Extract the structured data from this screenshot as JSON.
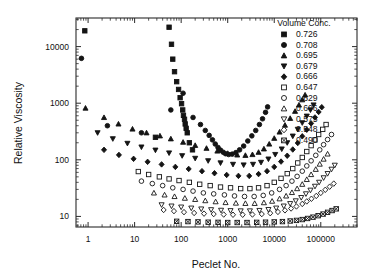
{
  "chart_data": {
    "type": "scatter",
    "title": "",
    "xlabel": "Peclet No.",
    "ylabel": "Relative Viscosity",
    "xscale": "log",
    "yscale": "log",
    "xlim": [
      0.55,
      600000
    ],
    "ylim": [
      6.5,
      32000
    ],
    "xticks": [
      1,
      10,
      100,
      1000,
      10000,
      100000
    ],
    "xticklabels": [
      "1",
      "10",
      "100",
      "1000",
      "10000",
      "100000"
    ],
    "yticks": [
      10,
      100,
      1000,
      10000
    ],
    "yticklabels": [
      "10",
      "100",
      "1000",
      "10000"
    ],
    "grid": false,
    "legend_position": "top-right",
    "legend_title": "Volume Conc.",
    "series": [
      {
        "name": "0.726",
        "marker": "square-filled",
        "points": [
          [
            0.85,
            19000
          ],
          [
            55,
            22000
          ],
          [
            62,
            11000
          ],
          [
            66,
            6000
          ],
          [
            72,
            3600
          ],
          [
            80,
            2400
          ],
          [
            88,
            1750
          ],
          [
            95,
            1250
          ],
          [
            102,
            980
          ],
          [
            108,
            760
          ],
          [
            112,
            610
          ],
          [
            118,
            520
          ],
          [
            122,
            430
          ],
          [
            128,
            360
          ],
          [
            135,
            300
          ],
          [
            28,
            250
          ],
          [
            150,
            200
          ],
          [
            175,
            150
          ]
        ]
      },
      {
        "name": "0.708",
        "marker": "circle-filled",
        "points": [
          [
            0.72,
            6200
          ],
          [
            110,
            1500
          ],
          [
            60,
            760
          ],
          [
            180,
            560
          ],
          [
            260,
            420
          ],
          [
            330,
            330
          ],
          [
            400,
            270
          ],
          [
            470,
            225
          ],
          [
            540,
            190
          ],
          [
            620,
            165
          ],
          [
            700,
            148
          ],
          [
            800,
            136
          ],
          [
            900,
            128
          ],
          [
            1050,
            124
          ],
          [
            1250,
            126
          ],
          [
            1500,
            134
          ],
          [
            1800,
            150
          ],
          [
            2200,
            175
          ],
          [
            2700,
            215
          ],
          [
            3300,
            265
          ],
          [
            4000,
            330
          ],
          [
            4800,
            420
          ],
          [
            5600,
            530
          ],
          [
            6500,
            690
          ],
          [
            7200,
            860
          ],
          [
            2.6,
            400
          ],
          [
            14,
            300
          ]
        ]
      },
      {
        "name": "0.695",
        "marker": "triangle-filled",
        "points": [
          [
            0.88,
            820
          ],
          [
            2.2,
            560
          ],
          [
            4.5,
            430
          ],
          [
            9,
            350
          ],
          [
            18,
            300
          ],
          [
            35,
            265
          ],
          [
            60,
            235
          ],
          [
            110,
            205
          ],
          [
            200,
            180
          ],
          [
            350,
            160
          ],
          [
            600,
            143
          ],
          [
            1000,
            130
          ],
          [
            1600,
            122
          ],
          [
            2400,
            120
          ],
          [
            3400,
            124
          ],
          [
            4600,
            136
          ],
          [
            6000,
            156
          ],
          [
            7800,
            190
          ],
          [
            10000,
            240
          ],
          [
            13000,
            310
          ],
          [
            17000,
            410
          ],
          [
            22000,
            540
          ],
          [
            28000,
            720
          ],
          [
            34000,
            930
          ],
          [
            40000,
            1150
          ],
          [
            46000,
            1400
          ]
        ]
      },
      {
        "name": "0.679",
        "marker": "triangle-down-filled",
        "points": [
          [
            1.6,
            300
          ],
          [
            3.4,
            235
          ],
          [
            7,
            195
          ],
          [
            14,
            168
          ],
          [
            28,
            148
          ],
          [
            55,
            132
          ],
          [
            105,
            118
          ],
          [
            200,
            106
          ],
          [
            380,
            96
          ],
          [
            700,
            88
          ],
          [
            1300,
            83
          ],
          [
            2200,
            81
          ],
          [
            3500,
            83
          ],
          [
            5200,
            90
          ],
          [
            7500,
            103
          ],
          [
            10500,
            124
          ],
          [
            14500,
            155
          ],
          [
            19000,
            200
          ],
          [
            25000,
            262
          ],
          [
            32000,
            345
          ],
          [
            40000,
            450
          ],
          [
            50000,
            590
          ],
          [
            60000,
            760
          ],
          [
            70000,
            930
          ]
        ]
      },
      {
        "name": "0.666",
        "marker": "diamond-filled",
        "points": [
          [
            2.2,
            150
          ],
          [
            4.6,
            122
          ],
          [
            9.5,
            104
          ],
          [
            19,
            92
          ],
          [
            38,
            83
          ],
          [
            75,
            75
          ],
          [
            145,
            69
          ],
          [
            280,
            63
          ],
          [
            520,
            58
          ],
          [
            950,
            54
          ],
          [
            1700,
            52
          ],
          [
            2900,
            52
          ],
          [
            4600,
            56
          ],
          [
            7000,
            63
          ],
          [
            10000,
            75
          ],
          [
            14000,
            93
          ],
          [
            19000,
            118
          ],
          [
            25000,
            152
          ],
          [
            32000,
            198
          ],
          [
            40000,
            260
          ],
          [
            50000,
            340
          ],
          [
            62000,
            440
          ],
          [
            75000,
            560
          ],
          [
            90000,
            700
          ],
          [
            105000,
            850
          ]
        ]
      },
      {
        "name": "0.647",
        "marker": "square-open",
        "points": [
          [
            12,
            62
          ],
          [
            20,
            55
          ],
          [
            34,
            50
          ],
          [
            55,
            46
          ],
          [
            90,
            43
          ],
          [
            150,
            40
          ],
          [
            250,
            37
          ],
          [
            420,
            35
          ],
          [
            700,
            33
          ],
          [
            1150,
            32
          ],
          [
            1900,
            31
          ],
          [
            3000,
            31
          ],
          [
            4600,
            32
          ],
          [
            7000,
            35
          ],
          [
            10000,
            40
          ],
          [
            14000,
            47
          ],
          [
            19000,
            57
          ],
          [
            25000,
            70
          ],
          [
            32000,
            88
          ],
          [
            40000,
            110
          ],
          [
            50000,
            140
          ],
          [
            62000,
            178
          ],
          [
            75000,
            225
          ],
          [
            90000,
            280
          ],
          [
            110000,
            345
          ],
          [
            130000,
            420
          ]
        ]
      },
      {
        "name": "0.629",
        "marker": "circle-open",
        "points": [
          [
            14,
            42
          ],
          [
            24,
            38
          ],
          [
            40,
            35
          ],
          [
            66,
            32
          ],
          [
            110,
            30
          ],
          [
            180,
            28
          ],
          [
            300,
            26
          ],
          [
            500,
            25
          ],
          [
            850,
            24
          ],
          [
            1400,
            23
          ],
          [
            2300,
            22.5
          ],
          [
            3700,
            22.5
          ],
          [
            5800,
            23.5
          ],
          [
            8800,
            26
          ],
          [
            13000,
            30
          ],
          [
            18000,
            35
          ],
          [
            24000,
            42
          ],
          [
            31000,
            51
          ],
          [
            40000,
            63
          ],
          [
            50000,
            78
          ],
          [
            62000,
            96
          ],
          [
            78000,
            120
          ],
          [
            95000,
            150
          ],
          [
            115000,
            185
          ],
          [
            140000,
            228
          ],
          [
            170000,
            280
          ]
        ]
      },
      {
        "name": "0.606",
        "marker": "triangle-open",
        "points": [
          [
            26,
            26
          ],
          [
            44,
            24
          ],
          [
            72,
            22.5
          ],
          [
            120,
            21
          ],
          [
            200,
            20
          ],
          [
            330,
            19
          ],
          [
            550,
            18.2
          ],
          [
            900,
            17.6
          ],
          [
            1500,
            17.2
          ],
          [
            2400,
            17
          ],
          [
            3800,
            17
          ],
          [
            6000,
            17.5
          ],
          [
            9000,
            18.6
          ],
          [
            13000,
            20.5
          ],
          [
            18000,
            23
          ],
          [
            24000,
            26.5
          ],
          [
            31000,
            31
          ],
          [
            40000,
            37
          ],
          [
            50000,
            45
          ],
          [
            62000,
            55
          ],
          [
            78000,
            68
          ],
          [
            95000,
            84
          ],
          [
            115000,
            103
          ],
          [
            140000,
            127
          ]
        ]
      },
      {
        "name": "0.575",
        "marker": "triangle-down-open",
        "points": [
          [
            38,
            16
          ],
          [
            62,
            15.2
          ],
          [
            100,
            14.6
          ],
          [
            165,
            14
          ],
          [
            270,
            13.5
          ],
          [
            440,
            13.1
          ],
          [
            720,
            12.8
          ],
          [
            1150,
            12.6
          ],
          [
            1900,
            12.5
          ],
          [
            3000,
            12.5
          ],
          [
            4800,
            12.7
          ],
          [
            7500,
            13.2
          ],
          [
            11000,
            14
          ],
          [
            16000,
            15.2
          ],
          [
            22000,
            16.8
          ],
          [
            29000,
            18.8
          ],
          [
            38000,
            21.5
          ],
          [
            48000,
            25
          ],
          [
            60000,
            29
          ],
          [
            75000,
            34
          ],
          [
            92000,
            40
          ],
          [
            115000,
            48
          ],
          [
            140000,
            57
          ],
          [
            170000,
            68
          ],
          [
            200000,
            80
          ]
        ]
      },
      {
        "name": "0.548",
        "marker": "diamond-open",
        "points": [
          [
            42,
            13
          ],
          [
            70,
            12.4
          ],
          [
            115,
            11.9
          ],
          [
            190,
            11.5
          ],
          [
            310,
            11.2
          ],
          [
            500,
            11
          ],
          [
            820,
            10.8
          ],
          [
            1300,
            10.7
          ],
          [
            2100,
            10.7
          ],
          [
            3400,
            10.8
          ],
          [
            5400,
            11
          ],
          [
            8200,
            11.4
          ],
          [
            12000,
            12
          ],
          [
            17000,
            12.8
          ],
          [
            23000,
            13.8
          ],
          [
            30000,
            15
          ],
          [
            40000,
            16.6
          ],
          [
            50000,
            18.4
          ],
          [
            63000,
            20.5
          ],
          [
            80000,
            23
          ],
          [
            100000,
            26
          ],
          [
            125000,
            29.5
          ],
          [
            155000,
            33.5
          ],
          [
            190000,
            38
          ]
        ]
      },
      {
        "name": "0.490",
        "marker": "square-crossed",
        "points": [
          [
            80,
            8.2
          ],
          [
            140,
            8.1
          ],
          [
            230,
            8.0
          ],
          [
            380,
            7.9
          ],
          [
            620,
            7.85
          ],
          [
            1000,
            7.8
          ],
          [
            1600,
            7.8
          ],
          [
            2600,
            7.8
          ],
          [
            4200,
            7.85
          ],
          [
            6500,
            7.9
          ],
          [
            10000,
            8.0
          ],
          [
            15000,
            8.1
          ],
          [
            22000,
            8.3
          ],
          [
            30000,
            8.5
          ],
          [
            40000,
            8.8
          ],
          [
            52000,
            9.2
          ],
          [
            68000,
            9.7
          ],
          [
            88000,
            10.3
          ],
          [
            112000,
            11.0
          ],
          [
            140000,
            11.8
          ],
          [
            175000,
            12.7
          ],
          [
            215000,
            13.6
          ]
        ]
      }
    ]
  },
  "legend": {
    "title": "Volume Conc.",
    "entries": [
      {
        "label": "0.726",
        "marker": "square-filled"
      },
      {
        "label": "0.708",
        "marker": "circle-filled"
      },
      {
        "label": "0.695",
        "marker": "triangle-filled"
      },
      {
        "label": "0.679",
        "marker": "triangle-down-filled"
      },
      {
        "label": "0.666",
        "marker": "diamond-filled"
      },
      {
        "label": "0.647",
        "marker": "square-open"
      },
      {
        "label": "0.629",
        "marker": "circle-open"
      },
      {
        "label": "0.606",
        "marker": "triangle-open"
      },
      {
        "label": "0.575",
        "marker": "triangle-down-open"
      },
      {
        "label": "0.548",
        "marker": "diamond-open"
      },
      {
        "label": "0.490",
        "marker": "square-crossed"
      }
    ]
  }
}
